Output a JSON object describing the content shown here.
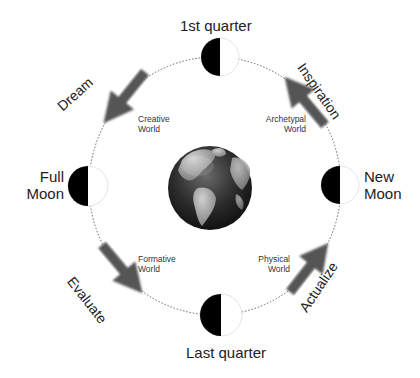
{
  "phases": {
    "top": "1st quarter",
    "left_line1": "Full",
    "left_line2": "Moon",
    "right_line1": "New",
    "right_line2": "Moon",
    "bottom": "Last quarter"
  },
  "worlds": {
    "creative_1": "Creative",
    "creative_2": "World",
    "archetypal_1": "Archetypal",
    "archetypal_2": "World",
    "formative_1": "Formative",
    "formative_2": "World",
    "physical_1": "Physical",
    "physical_2": "World"
  },
  "actions": {
    "dream": "Dream",
    "inspiration": "Inspiration",
    "evaluate": "Evaluate",
    "actualize": "Actualize"
  },
  "colors": {
    "arrow": "#555555",
    "moon_dark": "#000000",
    "moon_light": "#ffffff",
    "orbit": "#666666",
    "globe_ocean": "#2a2a2a",
    "globe_land": "#9a9a9a"
  },
  "icons": [
    "globe-icon",
    "half-moon-icon",
    "arrow-icon"
  ]
}
